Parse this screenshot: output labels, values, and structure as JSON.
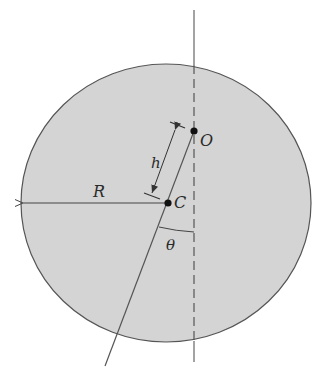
{
  "diagram": {
    "title": "",
    "colors": {
      "disk_fill": "#d4d4d4",
      "stroke": "#444444",
      "background": "#ffffff"
    },
    "disk": {
      "cx": 166,
      "cy": 203,
      "rx": 145,
      "ry": 139
    },
    "points": {
      "O": {
        "label": "O",
        "x": 194,
        "y": 131
      },
      "C": {
        "label": "C",
        "x": 168,
        "y": 203
      }
    },
    "labels": {
      "radius": "R",
      "offset": "h",
      "angle": "θ",
      "pivot": "O",
      "center": "C"
    },
    "elements": [
      "vertical dashed line through O",
      "line from O through C",
      "radius arrow from C to left edge",
      "dimension h between O and C",
      "angle θ between vertical and line OC"
    ]
  }
}
